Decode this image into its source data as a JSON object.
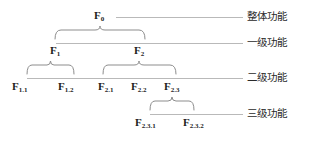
{
  "diagram": {
    "background_color": "#ffffff",
    "line_color": "#b9b9b9",
    "brace_color": "#8d8d8d",
    "text_color": "#1d1d1d",
    "nodes": {
      "f0": {
        "base": "F",
        "sub": "0"
      },
      "f1": {
        "base": "F",
        "sub": "1"
      },
      "f2": {
        "base": "F",
        "sub": "2"
      },
      "f11": {
        "base": "F",
        "sub": "1.1"
      },
      "f12": {
        "base": "F",
        "sub": "1.2"
      },
      "f21": {
        "base": "F",
        "sub": "2.1"
      },
      "f22": {
        "base": "F",
        "sub": "2.2"
      },
      "f23": {
        "base": "F",
        "sub": "2.3"
      },
      "f231": {
        "base": "F",
        "sub": "2.3.1"
      },
      "f232": {
        "base": "F",
        "sub": "2.3.2"
      }
    },
    "tiers": [
      {
        "label": "整体功能"
      },
      {
        "label": "一级功能"
      },
      {
        "label": "二级功能"
      },
      {
        "label": "三级功能"
      }
    ]
  }
}
